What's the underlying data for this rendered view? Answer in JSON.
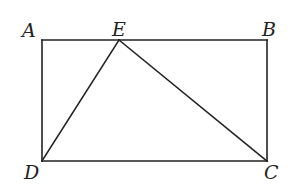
{
  "figure": {
    "type": "geometry",
    "stroke_color": "#222222",
    "background": "#ffffff",
    "points": {
      "A": {
        "x": 42,
        "y": 40
      },
      "E": {
        "x": 119,
        "y": 40
      },
      "B": {
        "x": 267,
        "y": 40
      },
      "C": {
        "x": 267,
        "y": 161
      },
      "D": {
        "x": 42,
        "y": 161
      }
    },
    "segments": [
      {
        "from": "A",
        "to": "B"
      },
      {
        "from": "B",
        "to": "C"
      },
      {
        "from": "C",
        "to": "D"
      },
      {
        "from": "D",
        "to": "A"
      },
      {
        "from": "D",
        "to": "E"
      },
      {
        "from": "E",
        "to": "C"
      }
    ],
    "labels": {
      "A": "A",
      "B": "B",
      "C": "C",
      "D": "D",
      "E": "E"
    }
  }
}
